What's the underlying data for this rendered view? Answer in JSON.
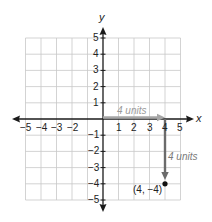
{
  "diagram": {
    "type": "coordinate-plane",
    "axes": {
      "x_label": "x",
      "y_label": "y",
      "x_range": [
        -5,
        5
      ],
      "y_range": [
        -5,
        5
      ],
      "x_ticks": [
        "-5",
        "-4",
        "-3",
        "-2",
        "1",
        "2",
        "3",
        "4",
        "5"
      ],
      "y_ticks_positive": [
        "5",
        "4",
        "3",
        "2",
        "1"
      ],
      "y_ticks_negative": [
        "-1",
        "-2",
        "-3",
        "-4",
        "-5"
      ]
    },
    "tick_text": {
      "xm5": "−5",
      "xm4": "−4",
      "xm3": "−3",
      "xm2": "−2",
      "x1": "1",
      "x2": "2",
      "x3": "3",
      "x4": "4",
      "x5": "5",
      "y5": "5",
      "y4": "4",
      "y3": "3",
      "y2": "2",
      "y1": "1",
      "ym1": "−1",
      "ym2": "−2",
      "ym3": "−3",
      "ym4": "−4",
      "ym5": "−5"
    },
    "grid": true,
    "horizontal_move": {
      "label": "4 units",
      "from": [
        0,
        0
      ],
      "to": [
        4,
        0
      ],
      "color": "#a6a6a6"
    },
    "vertical_move": {
      "label": "4 units",
      "from": [
        4,
        0
      ],
      "to": [
        4,
        -4
      ],
      "color": "#6b6b6b"
    },
    "point": {
      "label": "(4, −4)",
      "x": 4,
      "y": -4,
      "color": "#111111"
    },
    "colors": {
      "grid": "#c8c8c8",
      "axis": "#1a1a1a",
      "horizontal_arrow": "#a6a6a6",
      "vertical_arrow": "#6b6b6b",
      "unit_label_horizontal": "#9a9a9a",
      "unit_label_vertical": "#7a7a7a"
    }
  }
}
